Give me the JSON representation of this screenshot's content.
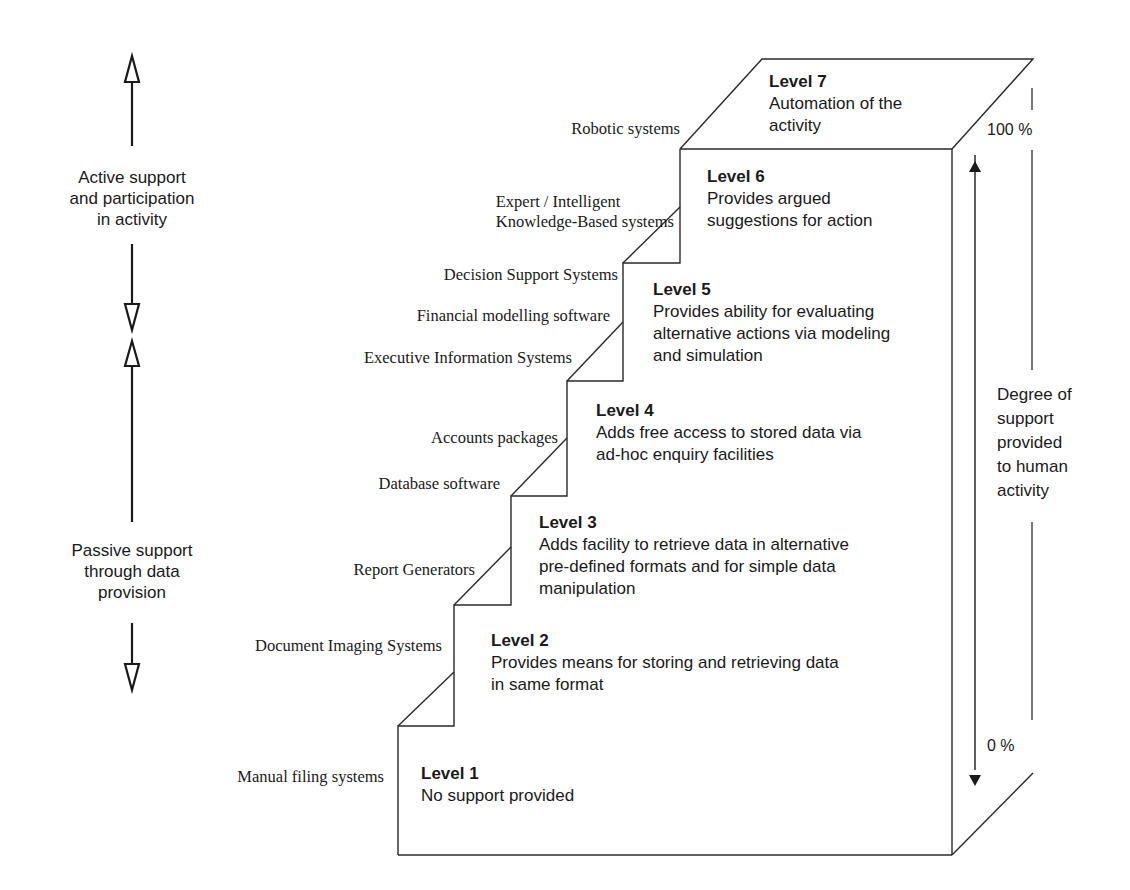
{
  "diagram": {
    "type": "staircase",
    "left_axis": {
      "active_label": "Active support\nand participation\nin activity",
      "passive_label": "Passive support\nthrough data\nprovision"
    },
    "right_axis": {
      "top_label": "100 %",
      "bottom_label": "0 %",
      "label": "Degree of\nsupport\nprovided\nto human\nactivity"
    },
    "levels": [
      {
        "title": "Level 1",
        "description": "No support provided",
        "systems": "Manual filing systems"
      },
      {
        "title": "Level 2",
        "description": "Provides means for storing and retrieving data\nin same format",
        "systems": "Document Imaging Systems"
      },
      {
        "title": "Level 3",
        "description": "Adds facility to retrieve data in alternative\npre-defined formats and for simple data\nmanipulation",
        "systems": "Report Generators"
      },
      {
        "title": "Level 4",
        "description": "Adds free access to stored data via\nad-hoc enquiry facilities",
        "systems": [
          "Accounts packages",
          "Database software"
        ]
      },
      {
        "title": "Level 5",
        "description": "Provides ability for evaluating\nalternative actions via modeling\nand simulation",
        "systems": [
          "Decision Support Systems",
          "Financial modelling software",
          "Executive Information Systems"
        ]
      },
      {
        "title": "Level 6",
        "description": "Provides argued\nsuggestions for action",
        "systems": "Expert / Intelligent\nKnowledge-Based systems"
      },
      {
        "title": "Level 7",
        "description": "Automation of the\nactivity",
        "systems": "Robotic systems"
      }
    ]
  }
}
